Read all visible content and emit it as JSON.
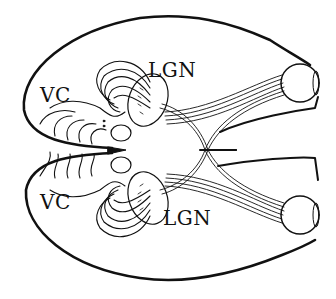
{
  "diagram": {
    "labels": {
      "lgn_top": "LGN",
      "lgn_bottom": "LGN",
      "vc_top": "VC",
      "vc_bottom": "VC"
    },
    "colors": {
      "ink": "#111111",
      "background": "#ffffff"
    }
  }
}
